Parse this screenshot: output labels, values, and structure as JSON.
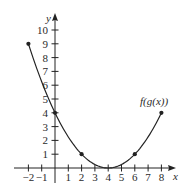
{
  "chart_data": {
    "type": "line",
    "title": "",
    "xlabel": "x",
    "ylabel": "y",
    "xlim": [
      -2,
      8
    ],
    "ylim": [
      0,
      10
    ],
    "grid": false,
    "x_ticks": [
      -2,
      -1,
      1,
      2,
      3,
      4,
      5,
      6,
      7,
      8
    ],
    "x_tick_labels": [
      "−2",
      "−1",
      "1",
      "2",
      "3",
      "4",
      "5",
      "6",
      "7",
      "8"
    ],
    "y_ticks": [
      1,
      2,
      3,
      4,
      5,
      6,
      7,
      8,
      9,
      10
    ],
    "y_tick_labels": [
      "1",
      "2",
      "3",
      "4",
      "5",
      "6",
      "7",
      "8",
      "9",
      "10"
    ],
    "series": [
      {
        "name": "f(g(x))",
        "label": "f(g(x))",
        "curve": "parabola (x-4)^2/4",
        "x": [
          -2,
          0,
          2,
          4,
          6,
          8
        ],
        "values": [
          9,
          4,
          1,
          0,
          1,
          4
        ],
        "marked_points": [
          [
            -2,
            9
          ],
          [
            0,
            4
          ],
          [
            2,
            1
          ],
          [
            6,
            1
          ],
          [
            8,
            4
          ]
        ],
        "color": "#222222"
      }
    ]
  },
  "axes": {
    "x_label": "x",
    "y_label": "y",
    "color": "#222222"
  }
}
